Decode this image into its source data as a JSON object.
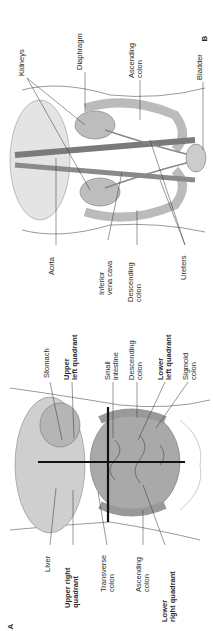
{
  "figure": {
    "panel_b": {
      "letter": "B",
      "labels_top": [
        {
          "id": "kidneys",
          "lines": [
            "Kidneys"
          ],
          "bold": false
        },
        {
          "id": "diaphragm",
          "lines": [
            "Diaphragm"
          ],
          "bold": false
        },
        {
          "id": "ascending-colon",
          "lines": [
            "Ascending",
            "colon"
          ],
          "bold": false
        },
        {
          "id": "bladder",
          "lines": [
            "Bladder"
          ],
          "bold": false
        }
      ],
      "labels_bottom": [
        {
          "id": "aorta",
          "lines": [
            "Aorta"
          ],
          "bold": false
        },
        {
          "id": "inferior-vena-cava",
          "lines": [
            "Inferior",
            "vena cava"
          ],
          "bold": false
        },
        {
          "id": "descending-colon",
          "lines": [
            "Descending",
            "colon"
          ],
          "bold": false
        },
        {
          "id": "ureters",
          "lines": [
            "Ureters"
          ],
          "bold": false
        }
      ]
    },
    "panel_a": {
      "letter": "A",
      "labels_top": [
        {
          "id": "stomach",
          "lines": [
            "Stomach"
          ],
          "bold": false
        },
        {
          "id": "upper-left-quadrant",
          "lines": [
            "Upper",
            "left quadrant"
          ],
          "bold": true
        },
        {
          "id": "small-intestine",
          "lines": [
            "Small",
            "intestine"
          ],
          "bold": false
        },
        {
          "id": "descending-colon",
          "lines": [
            "Descending",
            "colon"
          ],
          "bold": false
        },
        {
          "id": "lower-left-quadrant",
          "lines": [
            "Lower",
            "left quadrant"
          ],
          "bold": true
        },
        {
          "id": "sigmoid-colon",
          "lines": [
            "Sigmoid",
            "colon"
          ],
          "bold": false
        }
      ],
      "labels_bottom": [
        {
          "id": "liver",
          "lines": [
            "Liver"
          ],
          "bold": false
        },
        {
          "id": "upper-right-quadrant",
          "lines": [
            "Upper right",
            "quadrant"
          ],
          "bold": true
        },
        {
          "id": "transverse-colon",
          "lines": [
            "Transverse",
            "colon"
          ],
          "bold": false
        },
        {
          "id": "ascending-colon",
          "lines": [
            "Ascending",
            "colon"
          ],
          "bold": false
        },
        {
          "id": "lower-right-quadrant",
          "lines": [
            "Lower",
            "right quadrant"
          ],
          "bold": true
        }
      ]
    },
    "colors": {
      "ink": "#2a2a2a",
      "organ": "#9a9a9a",
      "organ_dark": "#6e6e6e",
      "quadrant_line": "#111111",
      "outline": "#555555"
    }
  }
}
